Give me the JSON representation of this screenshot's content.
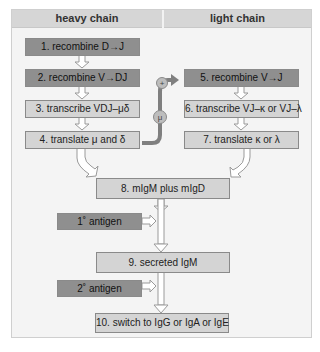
{
  "headers": {
    "left": "heavy chain",
    "right": "light chain"
  },
  "steps": [
    {
      "id": 1,
      "label": "1. recombine D→J",
      "style": "dark"
    },
    {
      "id": 2,
      "label": "2. recombine V→DJ",
      "style": "dark"
    },
    {
      "id": 3,
      "label": "3. transcribe VDJ–μδ",
      "style": "light"
    },
    {
      "id": 4,
      "label": "4. translate μ and δ",
      "style": "light"
    },
    {
      "id": 5,
      "label": "5. recombine V→J",
      "style": "dark"
    },
    {
      "id": 6,
      "label": "6. transcribe VJ–κ or VJ–λ",
      "style": "light"
    },
    {
      "id": 7,
      "label": "7. translate κ or λ",
      "style": "light"
    },
    {
      "id": 8,
      "label": "8. mIgM plus mIgD",
      "style": "light"
    },
    {
      "id": 9,
      "label": "9. secreted IgM",
      "style": "light"
    },
    {
      "id": 10,
      "label": "10. switch to IgG or IgA or IgE",
      "style": "light"
    }
  ],
  "inputs": {
    "primary_antigen": "1˚ antigen",
    "secondary_antigen": "2˚ antigen"
  },
  "connector": {
    "mu_label": "μ",
    "plus_label": "+"
  }
}
